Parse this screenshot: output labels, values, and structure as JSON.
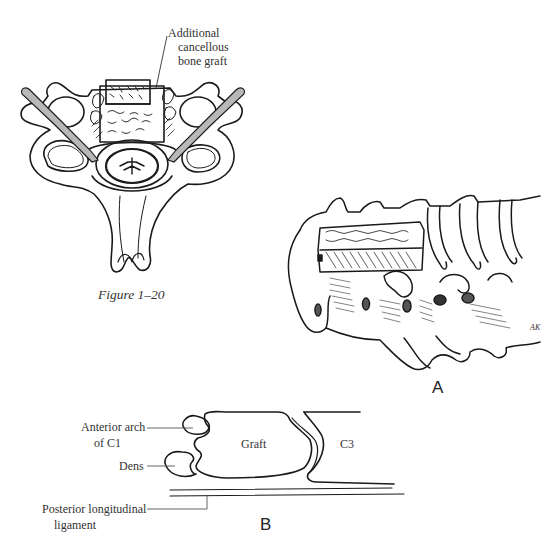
{
  "figure": {
    "caption": "Figure 1–20",
    "top_illustration": {
      "view": "axial cross-section of cervical vertebra with graft",
      "labels": {
        "graft_line1": "Additional",
        "graft_line2": "cancellous",
        "graft_line3": "bone graft"
      }
    },
    "panel_a": {
      "letter": "A",
      "view": "lateral view of cervical spine with anterior graft",
      "signature": "AK"
    },
    "panel_b": {
      "letter": "B",
      "labels": {
        "anterior_arch_line1": "Anterior arch",
        "anterior_arch_line2": "of C1",
        "dens": "Dens",
        "graft": "Graft",
        "c3": "C3",
        "pll_line1": "Posterior longitudinal",
        "pll_line2": "ligament"
      }
    }
  },
  "colors": {
    "ink": "#1a1a1a",
    "shade": "#b8b8b8",
    "background": "#ffffff"
  }
}
